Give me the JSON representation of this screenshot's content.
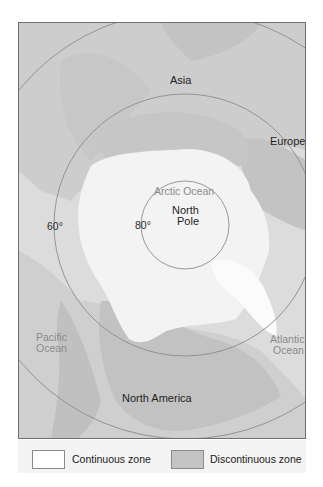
{
  "map": {
    "title": "Arctic permafrost distribution (polar projection)",
    "center_label": "North Pole",
    "labels": {
      "asia": "Asia",
      "europe": "Europe",
      "arctic_ocean": "Arctic Ocean",
      "north_pole_line1": "North",
      "north_pole_line2": "Pole",
      "deg_80": "80°",
      "deg_60": "60°",
      "pacific_line1": "Pacific",
      "pacific_line2": "Ocean",
      "atlantic_line1": "Atlantic",
      "atlantic_line2": "Ocean",
      "north_america": "North America"
    },
    "latitude_circles": [
      {
        "label": "80°",
        "radius_px": 44
      },
      {
        "label": "60°",
        "radius_px": 131
      },
      {
        "label": "",
        "radius_px": 214
      }
    ],
    "colors": {
      "ocean": "#dcdcdc",
      "land": "#cfcfcf",
      "continuous_zone": "#f3f3f3",
      "discontinuous_zone": "#c3c3c3",
      "circle_line": "#8c8c8c"
    }
  },
  "legend": {
    "items": [
      {
        "label": "Continuous zone",
        "color": "#ffffff"
      },
      {
        "label": "Discontinuous zone",
        "color": "#c4c4c4"
      }
    ]
  }
}
